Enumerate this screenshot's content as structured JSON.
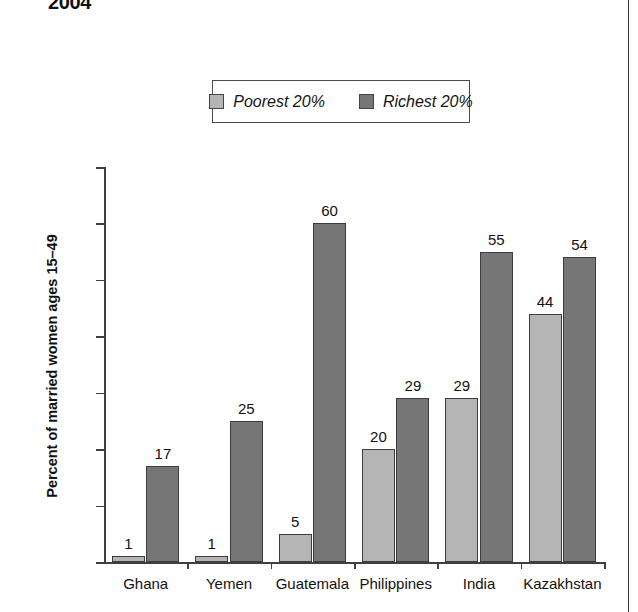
{
  "title": "2004",
  "legend": {
    "position": "top-center",
    "entries": [
      {
        "label": "Poorest 20%",
        "color": "#b5b5b5",
        "swatch": "poorest-swatch"
      },
      {
        "label": "Richest 20%",
        "color": "#767676",
        "swatch": "richest-swatch"
      }
    ]
  },
  "axes": {
    "ylabel": "Percent of married women ages 15–49",
    "yticks": [
      "0%",
      "10%",
      "20%",
      "30%",
      "40%",
      "50%",
      "60%",
      "70%"
    ],
    "xlabel": ""
  },
  "chart_data": {
    "type": "bar",
    "title": "2004",
    "xlabel": "",
    "ylabel": "Percent of married women ages 15–49",
    "ylim": [
      0,
      70
    ],
    "ytick_values": [
      0,
      10,
      20,
      30,
      40,
      50,
      60,
      70
    ],
    "ytick_labels": [
      "0%",
      "10%",
      "20%",
      "30%",
      "40%",
      "50%",
      "60%",
      "70%"
    ],
    "grid": false,
    "legend_position": "top-center",
    "categories": [
      "Ghana",
      "Yemen",
      "Guatemala",
      "Philippines",
      "India",
      "Kazakhstan"
    ],
    "series": [
      {
        "name": "Poorest 20%",
        "color": "#b5b5b5",
        "values": [
          1,
          1,
          5,
          20,
          29,
          44
        ],
        "labels": [
          "1",
          "1",
          "5",
          "20",
          "29",
          "44"
        ]
      },
      {
        "name": "Richest 20%",
        "color": "#767676",
        "values": [
          17,
          25,
          60,
          29,
          55,
          54
        ],
        "labels": [
          "17",
          "25",
          "60",
          "29",
          "55",
          "54"
        ]
      }
    ]
  }
}
